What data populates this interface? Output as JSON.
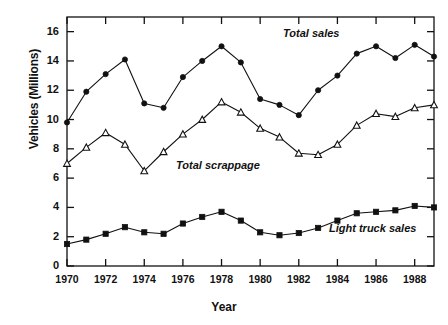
{
  "chart_data": {
    "type": "line",
    "title": "",
    "xlabel": "Year",
    "ylabel": "Vehicles (Millions)",
    "xlim": [
      1970,
      1989
    ],
    "ylim": [
      0,
      17
    ],
    "yticks": [
      0,
      2,
      4,
      6,
      8,
      10,
      12,
      14,
      16
    ],
    "xticks": [
      1970,
      1972,
      1974,
      1976,
      1978,
      1980,
      1982,
      1984,
      1986,
      1988
    ],
    "grid": false,
    "legend_position": "inline-annotations",
    "x": [
      1970,
      1971,
      1972,
      1973,
      1974,
      1975,
      1976,
      1977,
      1978,
      1979,
      1980,
      1981,
      1982,
      1983,
      1984,
      1985,
      1986,
      1987,
      1988,
      1989
    ],
    "series": [
      {
        "name": "Total sales",
        "marker": "filled-circle",
        "values": [
          9.8,
          11.9,
          13.1,
          14.1,
          11.1,
          10.8,
          12.9,
          14.0,
          15.0,
          13.9,
          11.4,
          11.0,
          10.3,
          12.0,
          13.0,
          14.5,
          15.0,
          14.2,
          15.1,
          14.3
        ]
      },
      {
        "name": "Total scrappage",
        "marker": "open-triangle",
        "values": [
          7.0,
          8.1,
          9.1,
          8.3,
          6.5,
          7.8,
          9.0,
          10.0,
          11.2,
          10.5,
          9.4,
          8.8,
          7.7,
          7.6,
          8.3,
          9.6,
          10.4,
          10.2,
          10.8,
          11.0
        ]
      },
      {
        "name": "Light truck sales",
        "marker": "filled-square",
        "values": [
          1.5,
          1.8,
          2.2,
          2.65,
          2.3,
          2.2,
          2.9,
          3.35,
          3.7,
          3.1,
          2.3,
          2.1,
          2.25,
          2.6,
          3.1,
          3.6,
          3.7,
          3.8,
          4.1,
          4.0
        ]
      }
    ]
  },
  "axis": {
    "ylabel": "Vehicles (Millions)",
    "xlabel": "Year",
    "ytick_labels": [
      "16",
      "14",
      "12",
      "10",
      "8",
      "6",
      "4",
      "2",
      "0"
    ],
    "xtick_labels": [
      "1970",
      "1972",
      "1974",
      "1976",
      "1978",
      "1980",
      "1982",
      "1984",
      "1986",
      "1988"
    ]
  },
  "annotations": {
    "total_sales": "Total sales",
    "total_scrappage": "Total scrappage",
    "light_truck_sales": "Light truck sales"
  },
  "colors": {
    "ink": "#111111",
    "background": "#ffffff"
  }
}
